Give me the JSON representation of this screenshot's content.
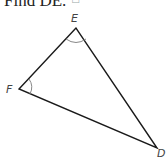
{
  "question": {
    "text": "Find DE.",
    "icon": "audio-icon",
    "icon_glyph": "□"
  },
  "diagram": {
    "vertices": [
      {
        "label": "E",
        "x": 76,
        "y": 28
      },
      {
        "label": "F",
        "x": 19,
        "y": 89
      },
      {
        "label": "D",
        "x": 157,
        "y": 148
      }
    ],
    "angle_marks": [
      "E",
      "F"
    ],
    "stroke_color": "#1a1a1a",
    "arc_color": "#888888"
  }
}
